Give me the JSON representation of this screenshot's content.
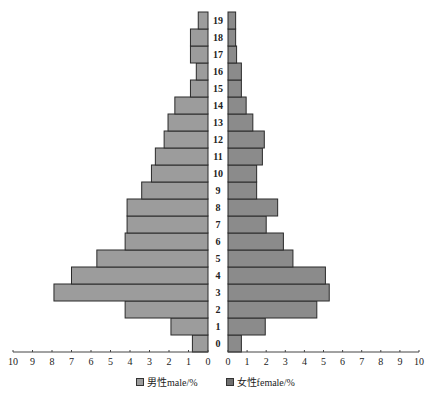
{
  "chart_data": {
    "type": "bar",
    "orientation": "horizontal",
    "subtype": "population-pyramid",
    "title": "",
    "categories": [
      "0",
      "1",
      "2",
      "3",
      "4",
      "5",
      "6",
      "7",
      "8",
      "9",
      "10",
      "11",
      "12",
      "13",
      "14",
      "15",
      "16",
      "17",
      "18",
      "19"
    ],
    "series": [
      {
        "name": "男性male/%",
        "side": "left",
        "color": "#9c9c9c",
        "values": [
          0.8,
          1.9,
          4.25,
          7.9,
          7.0,
          5.7,
          4.25,
          4.15,
          4.15,
          3.4,
          2.9,
          2.7,
          2.25,
          2.05,
          1.7,
          0.9,
          0.6,
          0.9,
          0.9,
          0.5
        ]
      },
      {
        "name": "女性female/%",
        "side": "right",
        "color": "#8b8b8b",
        "values": [
          0.7,
          1.95,
          4.65,
          5.3,
          5.1,
          3.4,
          2.9,
          2.0,
          2.6,
          1.5,
          1.5,
          1.8,
          1.9,
          1.3,
          0.95,
          0.7,
          0.7,
          0.45,
          0.4,
          0.4
        ]
      }
    ],
    "xlabel": "",
    "ylabel": "",
    "xlim_left": [
      10,
      0
    ],
    "xlim_right": [
      0,
      10
    ],
    "x_ticks_left": [
      "10",
      "9",
      "8",
      "7",
      "6",
      "5",
      "4",
      "3",
      "2",
      "1",
      "0"
    ],
    "x_ticks_right": [
      "0",
      "1",
      "2",
      "3",
      "4",
      "5",
      "6",
      "7",
      "8",
      "9",
      "10"
    ],
    "grid": false,
    "legend_position": "bottom"
  },
  "legend": {
    "male_label": "男性male/%",
    "female_label": "女性female/%"
  }
}
